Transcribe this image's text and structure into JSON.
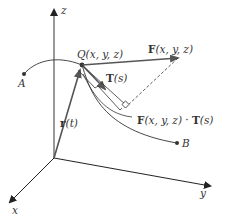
{
  "diagram": {
    "type": "3d-vector-line-integral",
    "axes": {
      "x_label": "x",
      "y_label": "y",
      "z_label": "z"
    },
    "points": {
      "A": "A",
      "B": "B",
      "Q": "Q(x, y, z)"
    },
    "vectors": {
      "position": "r(t)",
      "position_bold": "r",
      "position_arg": "(t)",
      "field": "F(x, y, z)",
      "field_bold": "F",
      "field_arg": "(x, y, z)",
      "tangent": "T(s)",
      "tangent_bold": "T",
      "tangent_arg": "(s)",
      "projection": "F(x, y, z) · T(s)",
      "projection_F": "F",
      "projection_F_arg": "(x, y, z) · ",
      "projection_T": "T",
      "projection_T_arg": "(s)"
    },
    "colors": {
      "axis": "#222222",
      "vector": "#555555",
      "curve": "#333333",
      "text": "#333333"
    }
  }
}
